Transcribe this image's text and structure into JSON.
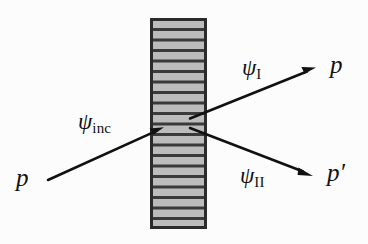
{
  "figure": {
    "type": "physics-scattering-diagram",
    "background_color": "#fcfcfc",
    "ink_color": "#111111",
    "barrier": {
      "fill_color": "#bcbcbc",
      "line_color": "#3a3a3a",
      "border_color": "#2b2b2b",
      "x": 151,
      "y": 19,
      "width": 55,
      "height": 209,
      "hatch_band_count": 20
    },
    "labels": {
      "incident_momentum": "p",
      "incident_wave_symbol": "ψ",
      "incident_wave_subscript": "inc",
      "channel_one_symbol": "ψ",
      "channel_one_subscript": "I",
      "channel_two_symbol": "ψ",
      "channel_two_subscript": "II",
      "outgoing_momentum_one": "p",
      "outgoing_momentum_two": "p",
      "outgoing_momentum_two_prime": "′"
    },
    "arrows": [
      {
        "name": "incident-wave-arrow",
        "label": "ψinc",
        "from": [
          48,
          180
        ],
        "to": [
          163,
          128
        ]
      },
      {
        "name": "channel-one-arrow",
        "label": "ψI",
        "from": [
          190,
          118
        ],
        "to": [
          315,
          68
        ]
      },
      {
        "name": "channel-two-arrow",
        "label": "ψII",
        "from": [
          190,
          128
        ],
        "to": [
          312,
          176
        ]
      }
    ]
  }
}
